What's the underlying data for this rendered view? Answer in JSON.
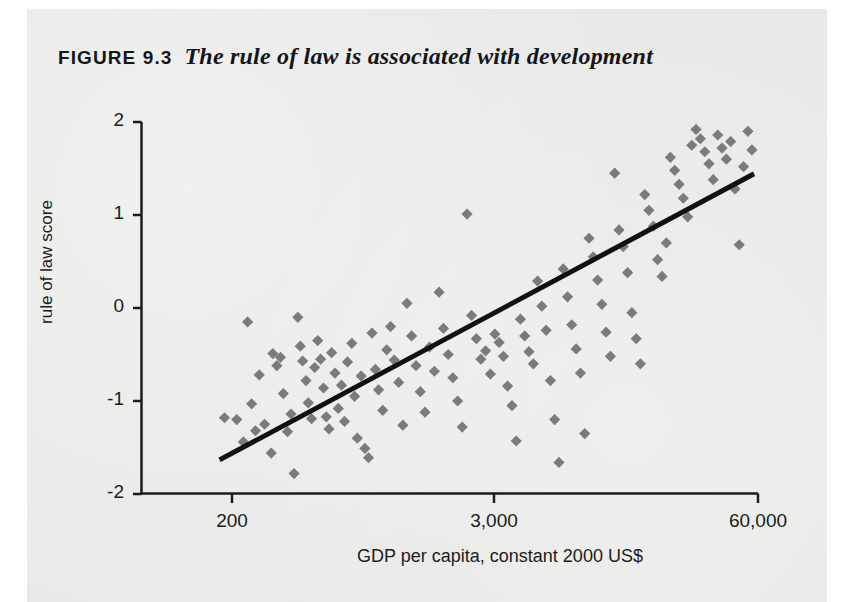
{
  "figure": {
    "number": "FIGURE 9.3",
    "caption": "The rule of law is associated with development"
  },
  "colors": {
    "paper_background": "#e9e9e7",
    "marker": "#7b7b7b",
    "axis": "#1b1c20",
    "trendline": "#111111",
    "text": "#15161a"
  },
  "chart_data": {
    "type": "scatter",
    "title": "The rule of law is associated with development",
    "xlabel": "GDP per capita, constant 2000 US$",
    "ylabel": "rule of law score",
    "grid": false,
    "legend": false,
    "xscale": "log",
    "x_tick_labels": [
      "200",
      "3,000",
      "60,000"
    ],
    "x_tick_values": [
      200,
      3000,
      60000
    ],
    "y_tick_labels": [
      "2",
      "1",
      "0",
      "-1",
      "-2"
    ],
    "y_tick_values": [
      2,
      1,
      0,
      -1,
      -2
    ],
    "ylim": [
      -2,
      2
    ],
    "xlim": [
      150,
      75000
    ],
    "trendline": {
      "type": "linear-fit",
      "x_start": 180,
      "y_start": -1.62,
      "x_end": 56000,
      "y_end": 1.43
    },
    "points": [
      {
        "x": 185,
        "y": -1.18
      },
      {
        "x": 210,
        "y": -1.2
      },
      {
        "x": 225,
        "y": -1.44
      },
      {
        "x": 235,
        "y": -0.15
      },
      {
        "x": 245,
        "y": -1.03
      },
      {
        "x": 255,
        "y": -1.32
      },
      {
        "x": 265,
        "y": -0.72
      },
      {
        "x": 280,
        "y": -1.25
      },
      {
        "x": 300,
        "y": -1.56
      },
      {
        "x": 305,
        "y": -0.49
      },
      {
        "x": 318,
        "y": -0.62
      },
      {
        "x": 330,
        "y": -0.53
      },
      {
        "x": 340,
        "y": -0.92
      },
      {
        "x": 355,
        "y": -1.33
      },
      {
        "x": 368,
        "y": -1.14
      },
      {
        "x": 380,
        "y": -1.78
      },
      {
        "x": 395,
        "y": -0.1
      },
      {
        "x": 405,
        "y": -0.41
      },
      {
        "x": 415,
        "y": -0.57
      },
      {
        "x": 430,
        "y": -0.78
      },
      {
        "x": 440,
        "y": -1.02
      },
      {
        "x": 455,
        "y": -1.19
      },
      {
        "x": 470,
        "y": -0.64
      },
      {
        "x": 485,
        "y": -0.35
      },
      {
        "x": 500,
        "y": -0.55
      },
      {
        "x": 515,
        "y": -0.86
      },
      {
        "x": 530,
        "y": -1.17
      },
      {
        "x": 545,
        "y": -1.3
      },
      {
        "x": 560,
        "y": -0.48
      },
      {
        "x": 580,
        "y": -0.7
      },
      {
        "x": 600,
        "y": -1.08
      },
      {
        "x": 620,
        "y": -0.83
      },
      {
        "x": 640,
        "y": -1.22
      },
      {
        "x": 660,
        "y": -0.58
      },
      {
        "x": 690,
        "y": -0.38
      },
      {
        "x": 710,
        "y": -0.95
      },
      {
        "x": 730,
        "y": -1.4
      },
      {
        "x": 760,
        "y": -0.73
      },
      {
        "x": 790,
        "y": -1.51
      },
      {
        "x": 820,
        "y": -1.61
      },
      {
        "x": 850,
        "y": -0.27
      },
      {
        "x": 880,
        "y": -0.66
      },
      {
        "x": 910,
        "y": -0.88
      },
      {
        "x": 950,
        "y": -1.1
      },
      {
        "x": 990,
        "y": -0.45
      },
      {
        "x": 1030,
        "y": -0.2
      },
      {
        "x": 1070,
        "y": -0.56
      },
      {
        "x": 1120,
        "y": -0.8
      },
      {
        "x": 1170,
        "y": -1.26
      },
      {
        "x": 1220,
        "y": 0.05
      },
      {
        "x": 1280,
        "y": -0.3
      },
      {
        "x": 1340,
        "y": -0.62
      },
      {
        "x": 1400,
        "y": -0.9
      },
      {
        "x": 1470,
        "y": -1.12
      },
      {
        "x": 1540,
        "y": -0.42
      },
      {
        "x": 1620,
        "y": -0.68
      },
      {
        "x": 1700,
        "y": 0.17
      },
      {
        "x": 1780,
        "y": -0.22
      },
      {
        "x": 1870,
        "y": -0.5
      },
      {
        "x": 1960,
        "y": -0.75
      },
      {
        "x": 2060,
        "y": -1.0
      },
      {
        "x": 2160,
        "y": -1.28
      },
      {
        "x": 2270,
        "y": 1.01
      },
      {
        "x": 2380,
        "y": -0.08
      },
      {
        "x": 2500,
        "y": -0.33
      },
      {
        "x": 2620,
        "y": -0.55
      },
      {
        "x": 2750,
        "y": -0.46
      },
      {
        "x": 2890,
        "y": -0.71
      },
      {
        "x": 3030,
        "y": -0.28
      },
      {
        "x": 3180,
        "y": -0.37
      },
      {
        "x": 3340,
        "y": -0.52
      },
      {
        "x": 3500,
        "y": -0.84
      },
      {
        "x": 3680,
        "y": -1.05
      },
      {
        "x": 3860,
        "y": -1.43
      },
      {
        "x": 4050,
        "y": -0.12
      },
      {
        "x": 4250,
        "y": -0.3
      },
      {
        "x": 4460,
        "y": -0.47
      },
      {
        "x": 4690,
        "y": -0.6
      },
      {
        "x": 4920,
        "y": 0.29
      },
      {
        "x": 5160,
        "y": 0.02
      },
      {
        "x": 5420,
        "y": -0.24
      },
      {
        "x": 5690,
        "y": -0.78
      },
      {
        "x": 5970,
        "y": -1.2
      },
      {
        "x": 6270,
        "y": -1.66
      },
      {
        "x": 6580,
        "y": 0.42
      },
      {
        "x": 6910,
        "y": 0.12
      },
      {
        "x": 7250,
        "y": -0.18
      },
      {
        "x": 7620,
        "y": -0.44
      },
      {
        "x": 8000,
        "y": -0.7
      },
      {
        "x": 8400,
        "y": -1.35
      },
      {
        "x": 8820,
        "y": 0.75
      },
      {
        "x": 9260,
        "y": 0.55
      },
      {
        "x": 9720,
        "y": 0.3
      },
      {
        "x": 10200,
        "y": 0.04
      },
      {
        "x": 10700,
        "y": -0.26
      },
      {
        "x": 11240,
        "y": -0.52
      },
      {
        "x": 11800,
        "y": 1.45
      },
      {
        "x": 12390,
        "y": 0.84
      },
      {
        "x": 13000,
        "y": 0.66
      },
      {
        "x": 13660,
        "y": 0.38
      },
      {
        "x": 14340,
        "y": -0.05
      },
      {
        "x": 15060,
        "y": -0.33
      },
      {
        "x": 15800,
        "y": -0.6
      },
      {
        "x": 16600,
        "y": 1.22
      },
      {
        "x": 17400,
        "y": 1.05
      },
      {
        "x": 18300,
        "y": 0.88
      },
      {
        "x": 19200,
        "y": 0.52
      },
      {
        "x": 20200,
        "y": 0.34
      },
      {
        "x": 21200,
        "y": 0.7
      },
      {
        "x": 22200,
        "y": 1.62
      },
      {
        "x": 23300,
        "y": 1.48
      },
      {
        "x": 24500,
        "y": 1.33
      },
      {
        "x": 25700,
        "y": 1.18
      },
      {
        "x": 27000,
        "y": 0.98
      },
      {
        "x": 28300,
        "y": 1.75
      },
      {
        "x": 29700,
        "y": 1.92
      },
      {
        "x": 31200,
        "y": 1.82
      },
      {
        "x": 32800,
        "y": 1.68
      },
      {
        "x": 34400,
        "y": 1.55
      },
      {
        "x": 36100,
        "y": 1.38
      },
      {
        "x": 38000,
        "y": 1.86
      },
      {
        "x": 39900,
        "y": 1.72
      },
      {
        "x": 41900,
        "y": 1.6
      },
      {
        "x": 44000,
        "y": 1.79
      },
      {
        "x": 46200,
        "y": 1.28
      },
      {
        "x": 48500,
        "y": 0.68
      },
      {
        "x": 50900,
        "y": 1.52
      },
      {
        "x": 53500,
        "y": 1.9
      },
      {
        "x": 56000,
        "y": 1.7
      }
    ]
  }
}
